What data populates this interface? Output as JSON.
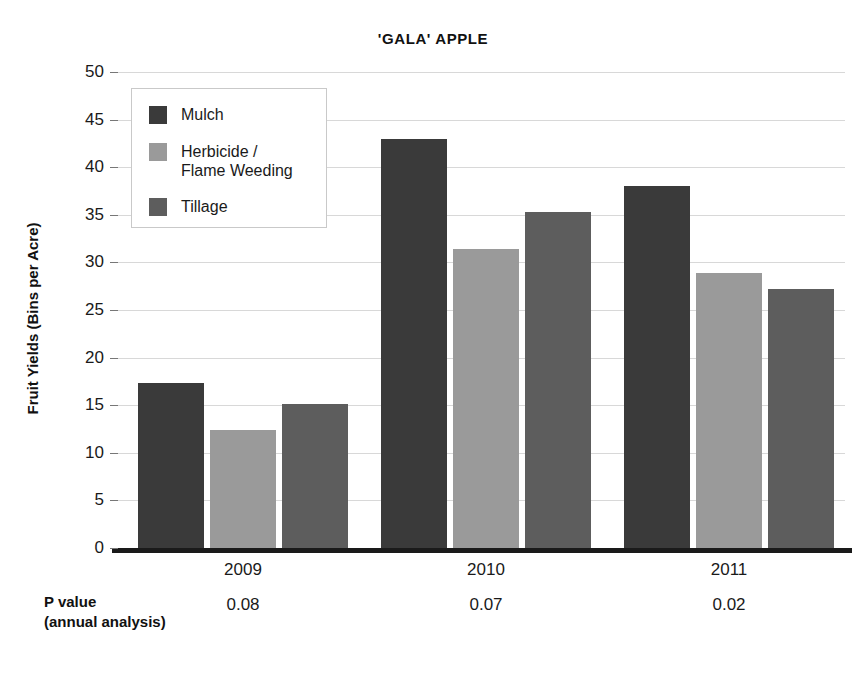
{
  "chart_data": {
    "type": "bar",
    "title": "'GALA' APPLE",
    "xlabel": "",
    "ylabel": "Fruit Yields (Bins per Acre)",
    "ylim": [
      0,
      50
    ],
    "ytick_step": 5,
    "yticks": [
      50,
      45,
      40,
      35,
      30,
      25,
      20,
      15,
      10,
      5,
      0
    ],
    "categories": [
      "2009",
      "2010",
      "2011"
    ],
    "grid": "horizontal",
    "legend_position": "upper-left-inside",
    "series": [
      {
        "name": "Mulch",
        "color": "#3a3a3a",
        "values": [
          17.3,
          43.0,
          38.0
        ]
      },
      {
        "name": "Herbicide /\nFlame Weeding",
        "color": "#9a9a9a",
        "values": [
          12.4,
          31.4,
          28.9
        ]
      },
      {
        "name": "Tillage",
        "color": "#5d5d5d",
        "values": [
          15.1,
          35.3,
          27.2
        ]
      }
    ],
    "annotations": {
      "pvalue_caption": "P value\n(annual analysis)",
      "pvalues": [
        "0.08",
        "0.07",
        "0.02"
      ]
    }
  }
}
